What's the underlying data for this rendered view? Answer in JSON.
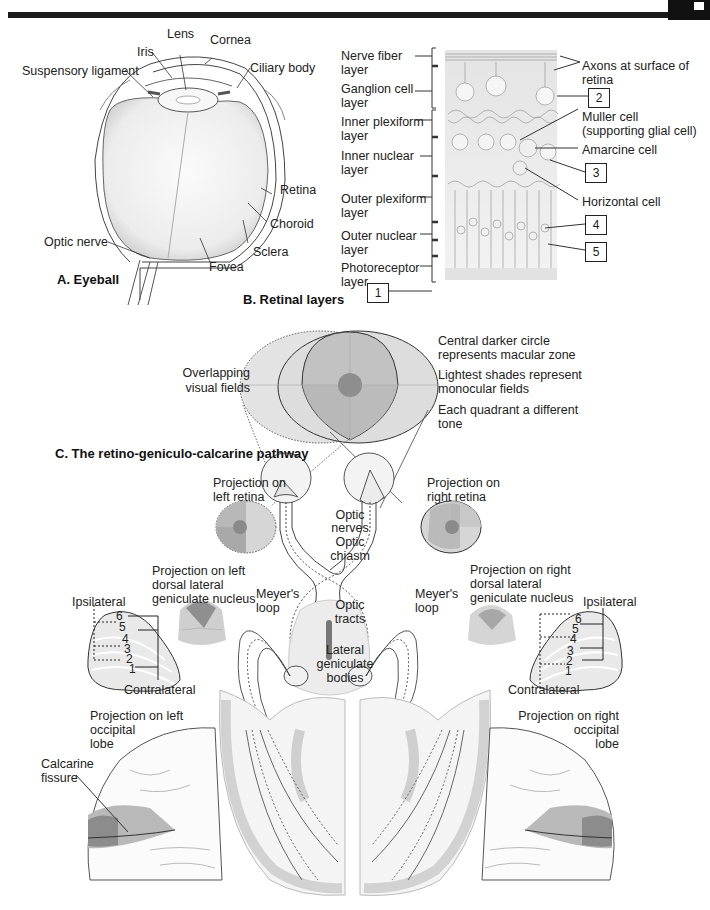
{
  "header": {
    "bar_color": "#1a1a1a"
  },
  "panel_a": {
    "title": "A. Eyeball",
    "labels": {
      "lens": "Lens",
      "cornea": "Cornea",
      "iris": "Iris",
      "suspensory_ligament": "Suspensory ligament",
      "ciliary_body": "Ciliary body",
      "retina": "Retina",
      "choroid": "Choroid",
      "sclera": "Sclera",
      "optic_nerve": "Optic nerve",
      "fovea": "Fovea"
    }
  },
  "panel_b": {
    "title": "B. Retinal layers",
    "layers": [
      {
        "line1": "Nerve fiber",
        "line2": "layer"
      },
      {
        "line1": "Ganglion cell",
        "line2": "layer"
      },
      {
        "line1": "Inner plexiform",
        "line2": "layer"
      },
      {
        "line1": "Inner nuclear",
        "line2": "layer"
      },
      {
        "line1": "Outer plexiform",
        "line2": "layer"
      },
      {
        "line1": "Outer nuclear",
        "line2": "layer"
      },
      {
        "line1": "Photoreceptor",
        "line2": "layer"
      }
    ],
    "right_labels": {
      "axons_1": "Axons at surface of",
      "axons_2": "retina",
      "muller_1": "Muller cell",
      "muller_2": "(supporting glial cell)",
      "amarcine": "Amarcine cell",
      "horizontal": "Horizontal cell"
    },
    "boxes": [
      "1",
      "2",
      "3",
      "4",
      "5"
    ]
  },
  "panel_c": {
    "title": "C. The retino-geniculo-calcarine pathway",
    "overlapping_1": "Overlapping",
    "overlapping_2": "visual fields",
    "notes": [
      {
        "line1": "Central darker circle",
        "line2": "represents macular zone"
      },
      {
        "line1": "Lightest shades represent",
        "line2": "monocular fields"
      },
      {
        "line1": "Each quadrant a different",
        "line2": "tone"
      }
    ],
    "left_retina_1": "Projection on",
    "left_retina_2": "left retina",
    "right_retina_1": "Projection on",
    "right_retina_2": "right retina",
    "optic_nerves_1": "Optic",
    "optic_nerves_2": "nerves",
    "optic_chiasm_1": "Optic",
    "optic_chiasm_2": "chiasm",
    "optic_tracts_1": "Optic",
    "optic_tracts_2": "tracts",
    "lgb_1": "Lateral",
    "lgb_2": "geniculate",
    "lgb_3": "bodies",
    "meyers_left_1": "Meyer's",
    "meyers_left_2": "loop",
    "meyers_right_1": "Meyer's",
    "meyers_right_2": "loop",
    "left_dlgn_1": "Projection on left",
    "left_dlgn_2": "dorsal lateral",
    "left_dlgn_3": "geniculate nucleus",
    "right_dlgn_1": "Projection on right",
    "right_dlgn_2": "dorsal lateral",
    "right_dlgn_3": "geniculate nucleus",
    "ipsilateral": "Ipsilateral",
    "contralateral": "Contralateral",
    "lgn_layers": [
      "6",
      "5",
      "4",
      "3",
      "2",
      "1"
    ],
    "left_occipital_1": "Projection on left",
    "left_occipital_2": "occipital",
    "left_occipital_3": "lobe",
    "right_occipital_1": "Projection on right",
    "right_occipital_2": "occipital",
    "right_occipital_3": "lobe",
    "calcarine_1": "Calcarine",
    "calcarine_2": "fissure"
  },
  "colors": {
    "field_light": "#dcdcdc",
    "field_mid": "#c4c4c4",
    "field_dark": "#a8a8a8",
    "macula": "#8a8a8a",
    "brain_gray": "#d6d6d6",
    "line": "#333333"
  }
}
